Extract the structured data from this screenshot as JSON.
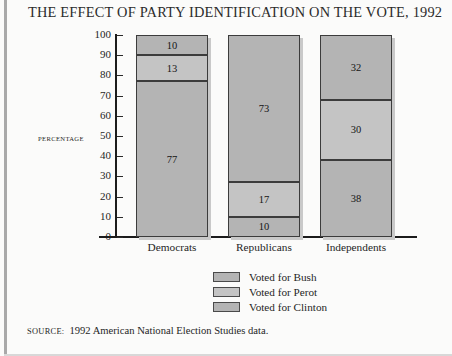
{
  "title": "THE EFFECT OF PARTY IDENTIFICATION ON THE VOTE, 1992",
  "axis": {
    "y_title": "PERCENTAGE",
    "ticks": [
      "100",
      "90",
      "80",
      "70",
      "60",
      "50",
      "40",
      "30",
      "20",
      "10",
      "0"
    ]
  },
  "legend": {
    "items": [
      {
        "label": "Voted for Bush",
        "color": "#b4b4b4"
      },
      {
        "label": "Voted for Perot",
        "color": "#c4c4c4"
      },
      {
        "label": "Voted for Clinton",
        "color": "#b4b4b4"
      }
    ]
  },
  "source": {
    "label": "SOURCE:",
    "text": "1992 American National Election Studies data."
  },
  "chart_data": {
    "type": "bar",
    "subtype": "stacked-100",
    "title": "THE EFFECT OF PARTY IDENTIFICATION ON THE VOTE, 1992",
    "xlabel": "",
    "ylabel": "PERCENTAGE",
    "ylim": [
      0,
      100
    ],
    "ytick_step": 10,
    "grid": false,
    "legend_position": "bottom-center",
    "categories": [
      "Democrats",
      "Republicans",
      "Independents"
    ],
    "series": [
      {
        "name": "Voted for Bush",
        "values": [
          10,
          73,
          32
        ],
        "color": "#b4b4b4"
      },
      {
        "name": "Voted for Perot",
        "values": [
          13,
          17,
          30
        ],
        "color": "#c4c4c4"
      },
      {
        "name": "Voted for Clinton",
        "values": [
          77,
          10,
          38
        ],
        "color": "#b4b4b4"
      }
    ],
    "stack_order_bottom_to_top": [
      "Voted for Clinton",
      "Voted for Perot",
      "Voted for Bush"
    ],
    "data_labels": true
  }
}
